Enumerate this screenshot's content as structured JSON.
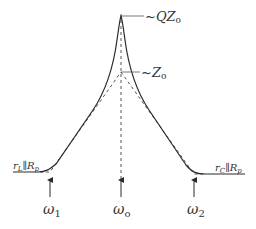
{
  "diagram": {
    "type": "impedance-vs-frequency",
    "colors": {
      "curve": "#2a2a2a",
      "dashed": "#555555",
      "text": "#333333",
      "background": "#ffffff"
    },
    "labels": {
      "peak": {
        "main": "~QZ",
        "sub": "o"
      },
      "mid": {
        "main": "~Z",
        "sub": "o"
      },
      "left_asymptote": {
        "r": "r",
        "r_sub": "L",
        "par": "∥",
        "R": "R",
        "R_sub": "p"
      },
      "right_asymptote": {
        "r": "r",
        "r_sub": "C",
        "par": "∥",
        "R": "R",
        "R_sub": "p"
      },
      "omega1": {
        "main": "ω",
        "sub": "1"
      },
      "omega0": {
        "main": "ω",
        "sub": "o"
      },
      "omega2": {
        "main": "ω",
        "sub": "2"
      }
    }
  }
}
